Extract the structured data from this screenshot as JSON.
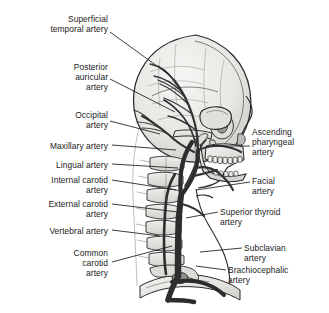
{
  "figure": {
    "name": "arteries-of-head-and-neck",
    "view": "right lateral view of skull, cervical spine and arterial tree",
    "background_color": "#ffffff",
    "ink_color": "#1b1b1b",
    "bone_fill": "#e8e8e6",
    "bone_shadow": "#c9c9c6",
    "vessel_color": "#3a3a3a"
  },
  "labels_left": [
    {
      "id": "superficial-temporal-artery",
      "text": "Superficial\ntemporal artery",
      "x": 12,
      "y": 14,
      "w": 96,
      "lead": [
        [
          110,
          32
        ],
        [
          168,
          74
        ]
      ]
    },
    {
      "id": "posterior-auricular-artery",
      "text": "Posterior\nauricular\nartery",
      "x": 20,
      "y": 62,
      "w": 88,
      "lead": [
        [
          110,
          79
        ],
        [
          175,
          112
        ]
      ]
    },
    {
      "id": "occipital-artery",
      "text": "Occipital\nartery",
      "x": 28,
      "y": 110,
      "w": 80,
      "lead": [
        [
          110,
          121
        ],
        [
          160,
          134
        ]
      ]
    },
    {
      "id": "maxillary-artery",
      "text": "Maxillary artery",
      "x": 12,
      "y": 141,
      "w": 96,
      "lead": [
        [
          112,
          145
        ],
        [
          176,
          150
        ]
      ]
    },
    {
      "id": "lingual-artery",
      "text": "Lingual artery",
      "x": 18,
      "y": 160,
      "w": 90,
      "lead": [
        [
          112,
          164
        ],
        [
          178,
          168
        ]
      ]
    },
    {
      "id": "internal-carotid-artery",
      "text": "Internal carotid\nartery",
      "x": 14,
      "y": 175,
      "w": 94,
      "lead": [
        [
          112,
          180
        ],
        [
          176,
          190
        ]
      ]
    },
    {
      "id": "external-carotid-artery",
      "text": "External carotid\nartery",
      "x": 12,
      "y": 199,
      "w": 96,
      "lead": [
        [
          112,
          204
        ],
        [
          178,
          212
        ]
      ]
    },
    {
      "id": "vertebral-artery",
      "text": "Vertebral artery",
      "x": 14,
      "y": 226,
      "w": 94,
      "lead": [
        [
          112,
          230
        ],
        [
          160,
          236
        ]
      ]
    },
    {
      "id": "common-carotid-artery",
      "text": "Common\ncarotid\nartery",
      "x": 30,
      "y": 248,
      "w": 78,
      "lead": [
        [
          112,
          262
        ],
        [
          172,
          246
        ]
      ]
    }
  ],
  "labels_right": [
    {
      "id": "ascending-pharyngeal-artery",
      "text": "Ascending\npharyngeal\nartery",
      "x": 252,
      "y": 127,
      "w": 74,
      "lead": [
        [
          250,
          146
        ],
        [
          212,
          146
        ]
      ]
    },
    {
      "id": "facial-artery",
      "text": "Facial\nartery",
      "x": 252,
      "y": 176,
      "w": 74,
      "lead": [
        [
          250,
          182
        ],
        [
          196,
          190
        ]
      ]
    },
    {
      "id": "superior-thyroid-artery",
      "text": "Superior thyroid\nartery",
      "x": 220,
      "y": 207,
      "w": 108,
      "lead": [
        [
          218,
          212
        ],
        [
          186,
          218
        ]
      ]
    },
    {
      "id": "subclavian-artery",
      "text": "Subclavian\nartery",
      "x": 244,
      "y": 243,
      "w": 84,
      "lead": [
        [
          242,
          248
        ],
        [
          200,
          252
        ]
      ]
    },
    {
      "id": "brachiocephalic-artery",
      "text": "Brachiocephalic\nartery",
      "x": 228,
      "y": 265,
      "w": 100,
      "lead": [
        [
          226,
          270
        ],
        [
          196,
          266
        ]
      ]
    }
  ]
}
